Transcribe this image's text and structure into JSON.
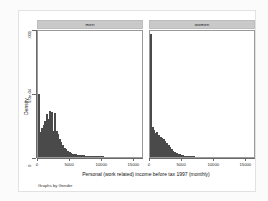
{
  "chart_data": {
    "type": "bar",
    "title": "",
    "subtitle": "",
    "note": "Graphs by Gender",
    "xlabel": "Personal (work related) income before tax 1997 (monthly)",
    "ylabel": "Density",
    "xlim": [
      0,
      16500
    ],
    "ylim": [
      0,
      0.001
    ],
    "grid": false,
    "legend": "none",
    "panel_variable": "Gender",
    "xticks": [
      0,
      5000,
      10000,
      15000
    ],
    "xticklabels": [
      "0",
      "5000",
      "10000",
      "15000"
    ],
    "yticks": [
      0,
      0.0005,
      0.001
    ],
    "yticklabels": [
      "0",
      "5.0e-04",
      ".001"
    ],
    "bin_width": 250,
    "panels": [
      {
        "label": "men",
        "bin_starts": [
          0,
          250,
          500,
          750,
          1000,
          1250,
          1500,
          1750,
          2000,
          2250,
          2500,
          2750,
          3000,
          3250,
          3500,
          3750,
          4000,
          4250,
          4500,
          4750,
          5000,
          5250,
          5500,
          5750,
          6000,
          6250,
          6500,
          6750,
          7000,
          7250,
          7500,
          7750,
          8000,
          8250,
          8500,
          8750,
          9000,
          9250,
          9500,
          9750,
          10000,
          10500,
          11000,
          11500,
          12000,
          12500,
          13000,
          13500,
          14000,
          14500,
          15000,
          15500,
          16000
        ],
        "densities": [
          0.000495,
          0.000195,
          0.00023,
          0.00025,
          0.000285,
          0.000335,
          0.0003,
          0.00036,
          0.000355,
          0.000205,
          0.000345,
          0.0002,
          0.00018,
          0.00014,
          0.000115,
          9e-05,
          7.2e-05,
          6e-05,
          4.8e-05,
          3.8e-05,
          3e-05,
          2.6e-05,
          2.2e-05,
          2e-05,
          1.8e-05,
          1.6e-05,
          1.4e-05,
          1.3e-05,
          1.2e-05,
          1.1e-05,
          1e-05,
          1e-05,
          9e-06,
          8e-06,
          8e-06,
          7e-06,
          7e-06,
          6e-06,
          6e-06,
          5e-06,
          5e-06,
          4e-06,
          4e-06,
          4e-06,
          3e-06,
          3e-06,
          3e-06,
          2e-06,
          2e-06,
          2e-06,
          2e-06,
          1e-06,
          1e-06
        ]
      },
      {
        "label": "women",
        "bin_starts": [
          0,
          250,
          500,
          750,
          1000,
          1250,
          1500,
          1750,
          2000,
          2250,
          2500,
          2750,
          3000,
          3250,
          3500,
          3750,
          4000,
          4250,
          4500,
          4750,
          5000,
          5250,
          5500,
          5750,
          6000,
          6250,
          6500,
          6750,
          7000,
          7250,
          7500,
          7750,
          8000,
          8250,
          8500,
          8750,
          9000,
          9500,
          10000,
          10500,
          11000,
          11500,
          12000,
          12500,
          13000
        ],
        "densities": [
          0.00096,
          0.000235,
          0.00021,
          0.000185,
          0.000195,
          0.000175,
          0.00016,
          0.00015,
          0.00014,
          0.000125,
          0.00011,
          9.5e-05,
          7.8e-05,
          6.2e-05,
          5e-05,
          4e-05,
          3.2e-05,
          2.5e-05,
          2e-05,
          1.6e-05,
          1.3e-05,
          1.1e-05,
          9e-06,
          8e-06,
          7e-06,
          6e-06,
          5e-06,
          5e-06,
          4e-06,
          4e-06,
          3e-06,
          3e-06,
          3e-06,
          2e-06,
          2e-06,
          2e-06,
          2e-06,
          1e-06,
          1e-06,
          1e-06,
          1e-06,
          1e-06,
          1e-06,
          1e-06,
          1e-06
        ]
      }
    ],
    "colors": {
      "bar": "#5f5f5f",
      "strip": "#c9c9c9",
      "axis": "#6a6a6a",
      "plot_background": "#ffffff",
      "canvas_background": "#ffffff"
    }
  }
}
